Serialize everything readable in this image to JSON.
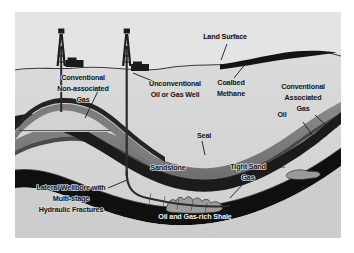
{
  "figure": {
    "type": "geologic-cross-section",
    "background_color": "#d9d9d9",
    "frame_color": "#ffffff",
    "labels": {
      "land_surface": "Land Surface",
      "conventional_non_associated_gas": [
        "Conventional",
        "Non-associated",
        "Gas"
      ],
      "unconventional_well": [
        "Unconventional",
        "Oil or Gas Well"
      ],
      "coalbed_methane": [
        "Coalbed",
        "Methane"
      ],
      "conventional_associated_gas": [
        "Conventional",
        "Associated",
        "Gas"
      ],
      "oil": "Oil",
      "seal": "Seal",
      "sandstone": "Sandstone",
      "tight_sand_gas": [
        "Tight Sand",
        "Gas"
      ],
      "lateral_wellbore": [
        "Lateral Wellbore with",
        "Multi-stage",
        "Hydraulic Fractures"
      ],
      "oil_and_gas_rich_shale": "Oil and Gas-rich Shale"
    },
    "colors": {
      "background": "#d9d9d9",
      "seal_dark": "#1c1c1c",
      "reservoir_gray": "#7a7a7a",
      "shale_black": "#111111",
      "gas_cap_light": "#c2c2c2",
      "sand_lens": "#8f8f8f",
      "well_casing": "#2b2b2b",
      "label_text": "#141414",
      "label_text_on_dark": "#f2f2f2"
    },
    "features": [
      {
        "name": "conventional-well-derrick",
        "count": 2
      },
      {
        "name": "anticline-trap",
        "count": 1
      },
      {
        "name": "coal-seam-lens",
        "count": 1
      },
      {
        "name": "tight-sand-lens",
        "count": 1
      },
      {
        "name": "shale-gas-lens",
        "count": 1
      },
      {
        "name": "horizontal-lateral-wellbore",
        "count": 1
      }
    ]
  }
}
